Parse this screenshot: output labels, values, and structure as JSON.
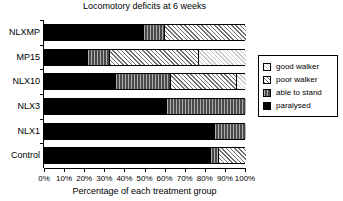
{
  "chart": {
    "title": "Locomotory deficits at 6 weeks",
    "xlabel": "Percentage of each treatment group",
    "ylabel": ""
  },
  "legend": {
    "items": [
      {
        "label": "good walker",
        "key": "good",
        "swatch": "checkered-light-swatch"
      },
      {
        "label": "poor walker",
        "key": "poor",
        "swatch": "diagonal-hatch-swatch"
      },
      {
        "label": "able to stand",
        "key": "stand",
        "swatch": "dark-vertical-hatch-swatch"
      },
      {
        "label": "paralysed",
        "key": "paralysed",
        "swatch": "solid-black-swatch"
      }
    ]
  },
  "axis": {
    "ticks": [
      "0%",
      "10%",
      "20%",
      "30%",
      "40%",
      "50%",
      "60%",
      "70%",
      "80%",
      "90%",
      "100%"
    ],
    "min": 0,
    "max": 100
  },
  "chart_data": {
    "type": "bar",
    "orientation": "horizontal",
    "stacked": true,
    "stack_total": 100,
    "title": "Locomotory deficits at 6 weeks",
    "xlabel": "Percentage of each treatment group",
    "ylabel": "",
    "xlim": [
      0,
      100
    ],
    "xticks": [
      0,
      10,
      20,
      30,
      40,
      50,
      60,
      70,
      80,
      90,
      100
    ],
    "grid": false,
    "legend_position": "right",
    "categories": [
      "NLXMP",
      "MP15",
      "NLX10",
      "NLX3",
      "NLX1",
      "Control"
    ],
    "series": [
      {
        "name": "paralysed",
        "values": [
          49,
          21,
          35,
          60,
          84,
          82
        ]
      },
      {
        "name": "able to stand",
        "values": [
          10,
          11,
          27,
          40,
          16,
          4
        ]
      },
      {
        "name": "poor walker",
        "values": [
          41,
          44,
          33,
          0,
          0,
          14
        ]
      },
      {
        "name": "good walker",
        "values": [
          0,
          24,
          5,
          0,
          0,
          0
        ]
      }
    ]
  }
}
